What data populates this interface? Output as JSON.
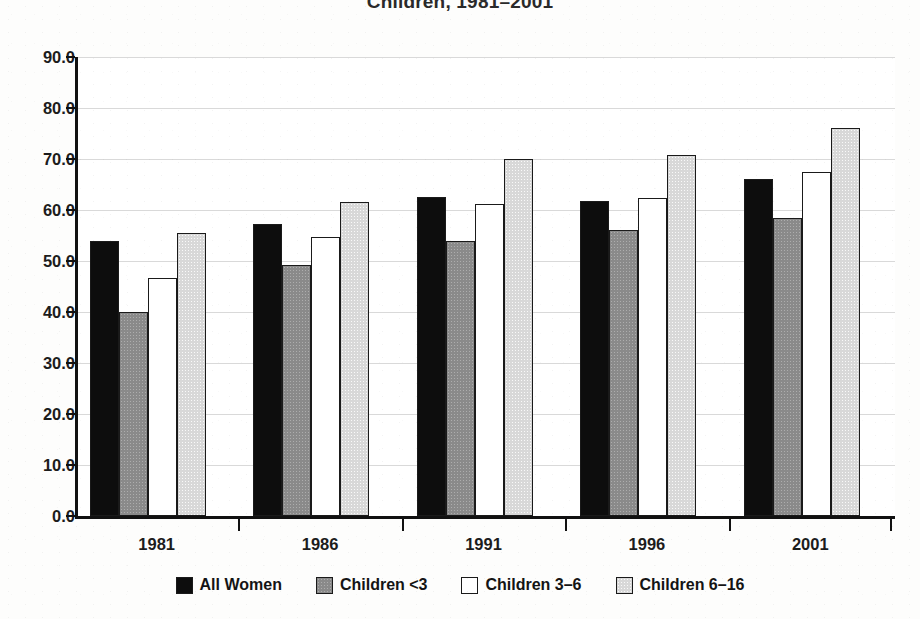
{
  "chart_data": {
    "type": "bar",
    "title": "Children, 1981–2001",
    "xlabel": "",
    "ylabel": "",
    "ylim": [
      0,
      90
    ],
    "ytick_step": 10,
    "ytick_labels": [
      "0.0",
      "10.0",
      "20.0",
      "30.0",
      "40.0",
      "50.0",
      "60.0",
      "70.0",
      "80.0",
      "90.0"
    ],
    "grid": true,
    "legend_position": "bottom",
    "categories": [
      "1981",
      "1986",
      "1991",
      "1996",
      "2001"
    ],
    "series": [
      {
        "name": "All Women",
        "swatch": "#0d0d0d",
        "values": [
          54.0,
          57.3,
          62.6,
          61.8,
          66.0
        ]
      },
      {
        "name": "Children <3",
        "swatch": "#8a8a8a",
        "values": [
          40.0,
          49.2,
          54.0,
          56.0,
          58.5
        ]
      },
      {
        "name": "Children 3–6",
        "swatch": "#ffffff",
        "values": [
          46.7,
          54.8,
          61.2,
          62.3,
          67.4
        ]
      },
      {
        "name": "Children 6–16",
        "swatch": "#d8d8d8",
        "values": [
          55.5,
          61.5,
          70.1,
          70.8,
          76.0
        ]
      }
    ]
  },
  "colors": {
    "axis": "#111111",
    "grid": "#d9d9d9",
    "background": "#fdfdfc",
    "plot_background": "#ffffff",
    "text": "#1c1c1c"
  }
}
